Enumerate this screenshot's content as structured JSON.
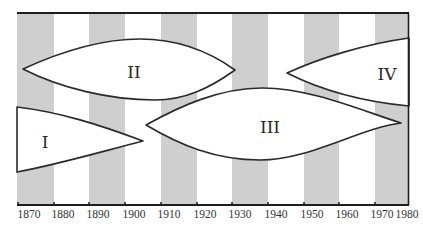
{
  "diagram": {
    "type": "timeline-lens-diagram",
    "colors": {
      "stripe": "#cfcfcf",
      "shape_fill": "#ffffff",
      "outline": "#2a2a2a"
    },
    "axis": {
      "start_year": 1870,
      "end_year": 1980,
      "ticks": [
        {
          "year": 1870,
          "label": "1870"
        },
        {
          "year": 1880,
          "label": "1880"
        },
        {
          "year": 1890,
          "label": "1890"
        },
        {
          "year": 1900,
          "label": "1900"
        },
        {
          "year": 1910,
          "label": "1910"
        },
        {
          "year": 1920,
          "label": "1920"
        },
        {
          "year": 1930,
          "label": "1930"
        },
        {
          "year": 1940,
          "label": "1940"
        },
        {
          "year": 1950,
          "label": "1950"
        },
        {
          "year": 1960,
          "label": "1960"
        },
        {
          "year": 1970,
          "label": "1970"
        },
        {
          "year": 1980,
          "label": "1980"
        }
      ]
    },
    "shaded_decades": [
      "1870-1880",
      "1890-1900",
      "1910-1920",
      "1930-1940",
      "1950-1960",
      "1970-1980"
    ],
    "eras": [
      {
        "id": "I",
        "label": "I",
        "start_year": "before 1870",
        "end_year": "c. 1905"
      },
      {
        "id": "II",
        "label": "II",
        "start_year": "c. 1871",
        "end_year": "c. 1931"
      },
      {
        "id": "III",
        "label": "III",
        "start_year": "c. 1906",
        "end_year": "c. 1978"
      },
      {
        "id": "IV",
        "label": "IV",
        "start_year": "c. 1945",
        "end_year": "after 1980"
      }
    ]
  }
}
